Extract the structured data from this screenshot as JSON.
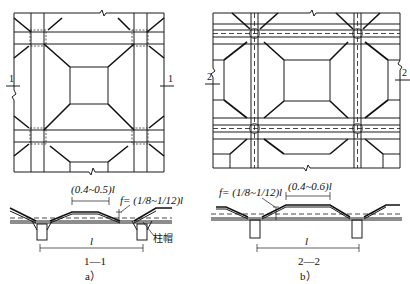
{
  "figure": {
    "panel_a": {
      "caption": "a）",
      "section_label": "1—1",
      "section_marks": [
        "1",
        "1"
      ],
      "dim_top": "(0.4~0.5)l",
      "rise": "f= (1/8~1/12)l",
      "span": "l",
      "column_cap_label": "柱帽"
    },
    "panel_b": {
      "caption": "b）",
      "section_label": "2—2",
      "section_marks": [
        "2",
        "2"
      ],
      "dim_top": "(0.4~0.6)l",
      "rise": "f= (1/8~1/12)l",
      "span": "l"
    }
  }
}
